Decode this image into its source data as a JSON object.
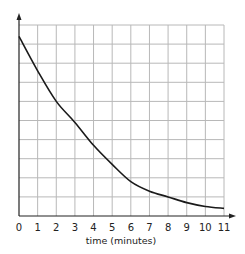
{
  "chart_data": {
    "type": "line",
    "title": "",
    "xlabel": "time (minutes)",
    "ylabel": "",
    "x": [
      0,
      1,
      2,
      3,
      4,
      5,
      6,
      7,
      8,
      9,
      10,
      11
    ],
    "series": [
      {
        "name": "curve",
        "values": [
          9.4,
          7.6,
          6.0,
          4.9,
          3.7,
          2.7,
          1.8,
          1.3,
          1.0,
          0.7,
          0.5,
          0.4
        ]
      }
    ],
    "xticks": [
      "0",
      "1",
      "2",
      "3",
      "4",
      "5",
      "6",
      "7",
      "8",
      "9",
      "10",
      "11"
    ],
    "yticks": [],
    "xlim": [
      0,
      11
    ],
    "ylim": [
      0,
      10
    ],
    "grid": true,
    "legend": null
  },
  "colors": {
    "grid": "#b8b8b8",
    "axis": "#222222",
    "line": "#1a1a1a"
  }
}
